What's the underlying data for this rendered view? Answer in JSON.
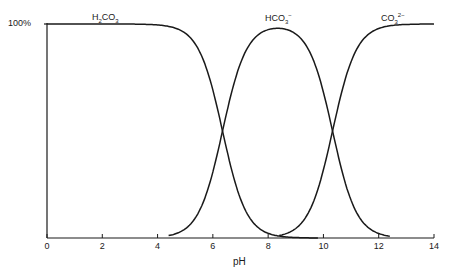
{
  "chart_data": {
    "type": "line",
    "title": "",
    "xlabel": "pH",
    "ylabel": "",
    "xlim": [
      0,
      14
    ],
    "ylim": [
      0,
      100
    ],
    "grid": false,
    "x_ticks": [
      0,
      2,
      4,
      6,
      8,
      10,
      12,
      14
    ],
    "x_tick_labels": [
      "0",
      "2",
      "4",
      "6",
      "8",
      "10",
      "12",
      "14"
    ],
    "y_tick_labels": [
      "100%"
    ],
    "pKa1": 6.35,
    "pKa2": 10.33,
    "series": [
      {
        "name": "H2CO3",
        "label_main": "H",
        "label_sub1": "2",
        "label_mid": "CO",
        "label_sub2": "3",
        "label_sup": ""
      },
      {
        "name": "HCO3-",
        "label_main": "",
        "label_sub1": "",
        "label_mid": "HCO",
        "label_sub2": "3",
        "label_sup": "−"
      },
      {
        "name": "CO3 2-",
        "label_main": "",
        "label_sub1": "",
        "label_mid": "CO",
        "label_sub2": "3",
        "label_sup": "2−"
      }
    ],
    "sample_points": {
      "x": [
        0,
        2,
        4,
        5,
        5.5,
        6,
        6.35,
        7,
        7.5,
        8,
        8.5,
        9,
        9.5,
        10,
        10.33,
        11,
        11.5,
        12,
        14
      ],
      "H2CO3": [
        100,
        100,
        99.5,
        95.7,
        87.6,
        69.1,
        50,
        18.3,
        6.6,
        2.2,
        0.7,
        0.2,
        0,
        0,
        0,
        0,
        0,
        0,
        0
      ],
      "HCO3-": [
        0,
        0,
        0.5,
        4.3,
        12.4,
        30.9,
        50,
        81.5,
        93.2,
        97.1,
        97.4,
        95.3,
        87.0,
        67.8,
        50,
        17.6,
        6.3,
        2.1,
        0
      ],
      "CO3 2-": [
        0,
        0,
        0,
        0,
        0,
        0,
        0,
        0.2,
        0.2,
        0.7,
        1.9,
        4.5,
        12.9,
        32.1,
        50,
        82.4,
        93.7,
        97.9,
        100
      ]
    }
  },
  "labels": {
    "y_top": "100%",
    "x_axis": "pH"
  }
}
